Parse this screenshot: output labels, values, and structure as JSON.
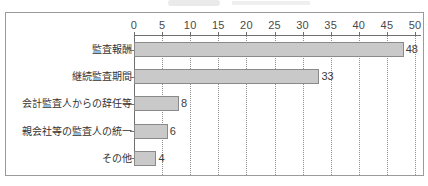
{
  "chart_data": {
    "type": "bar",
    "orientation": "horizontal",
    "title": "",
    "subtitle": "",
    "xlabel": "",
    "ylabel": "",
    "categories": [
      "監査報酬",
      "継続監査期間",
      "会計監査人からの辞任等",
      "親会社等の監査人の統一",
      "その他"
    ],
    "values": [
      48,
      33,
      8,
      6,
      4
    ],
    "value_labels": [
      "48",
      "33",
      "8",
      "6",
      "4"
    ],
    "xlim": [
      0,
      50
    ],
    "xticks": [
      0,
      5,
      10,
      15,
      20,
      25,
      30,
      35,
      40,
      45,
      50
    ],
    "xtick_labels": [
      "0",
      "5",
      "10",
      "15",
      "20",
      "25",
      "30",
      "35",
      "40",
      "45",
      "50"
    ],
    "grid": true,
    "grid_style": "dotted-vertical",
    "legend": null,
    "legend_position": "none",
    "axis_position": "top",
    "colors": {
      "bar_fill": "#c9c9c9",
      "bar_stroke": "#8a8a8a",
      "axis": "#6f6f6f",
      "grid": "#8d8d8d",
      "frame": "#9b9b9b",
      "text": "#333333",
      "background": "#ffffff"
    }
  }
}
